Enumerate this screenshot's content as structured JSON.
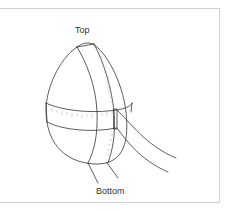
{
  "figure": {
    "labels": {
      "top": "Top",
      "bottom": "Bottom"
    },
    "colors": {
      "line": "#333333",
      "frame": "#cfcfcf",
      "tick": "#aaaaaa"
    }
  }
}
